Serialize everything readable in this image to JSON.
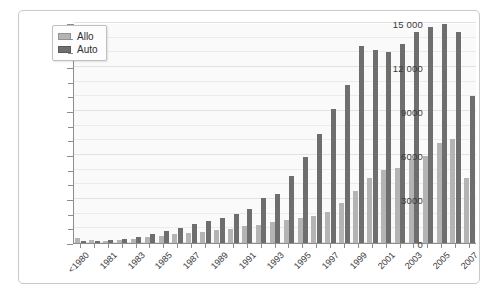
{
  "chart_data": {
    "type": "bar",
    "title": "",
    "subtitle": "",
    "xlabel": "",
    "ylabel": "",
    "ylim": [
      0,
      15000
    ],
    "grid": true,
    "legend_position": "top-left",
    "y_major_ticks": [
      0,
      3000,
      6000,
      9000,
      12000,
      15000
    ],
    "y_major_tick_labels": [
      "0",
      "3000",
      "6000",
      "9000",
      "12 000",
      "15 000"
    ],
    "y_minor_tick_step": 1000,
    "categories": [
      "<1980",
      "1980",
      "1981",
      "1982",
      "1983",
      "1984",
      "1985",
      "1986",
      "1987",
      "1988",
      "1989",
      "1990",
      "1991",
      "1992",
      "1993",
      "1994",
      "1995",
      "1996",
      "1997",
      "1998",
      "1999",
      "2000",
      "2001",
      "2002",
      "2003",
      "2004",
      "2005",
      "2006",
      "2007"
    ],
    "visible_tick_labels": [
      "<1980",
      "1981",
      "1983",
      "1985",
      "1987",
      "1989",
      "1991",
      "1993",
      "1995",
      "1997",
      "1999",
      "2001",
      "2003",
      "2005",
      "2007"
    ],
    "series": [
      {
        "name": "Allo",
        "color": "#b4b4b4",
        "values": [
          330,
          180,
          170,
          230,
          300,
          380,
          500,
          620,
          700,
          760,
          880,
          980,
          1150,
          1250,
          1400,
          1550,
          1700,
          1850,
          2100,
          2700,
          3550,
          4400,
          4950,
          5100,
          5700,
          5900,
          6800,
          7100,
          4400
        ]
      },
      {
        "name": "Auto",
        "color": "#6e6e6e",
        "values": [
          150,
          120,
          180,
          300,
          420,
          600,
          800,
          1050,
          1300,
          1500,
          1700,
          1950,
          2350,
          3050,
          3350,
          4550,
          5850,
          7450,
          9150,
          10750,
          13450,
          13150,
          13000,
          13550,
          14400,
          14750,
          14950,
          14400,
          10000
        ]
      }
    ]
  },
  "legend": {
    "items": [
      {
        "label": "Allo",
        "color": "#b4b4b4"
      },
      {
        "label": "Auto",
        "color": "#6e6e6e"
      }
    ]
  }
}
